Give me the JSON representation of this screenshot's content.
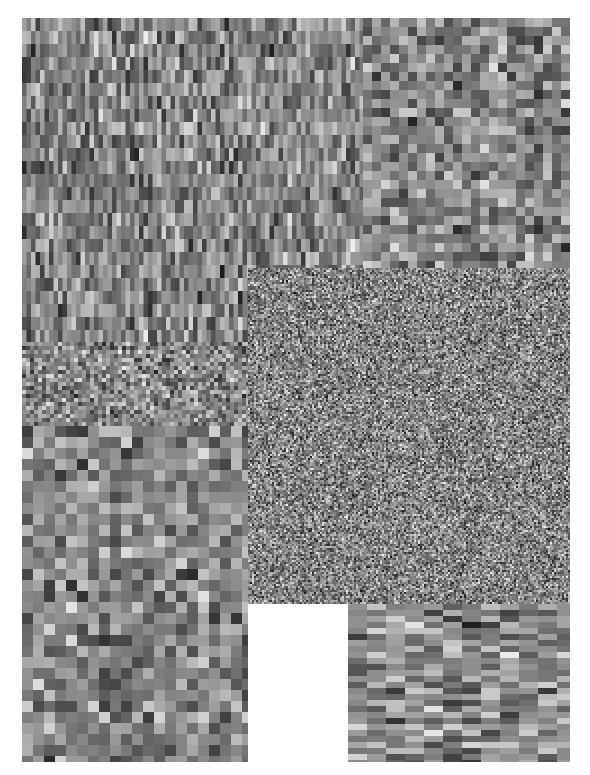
{
  "image": {
    "title": "grayscale-block-noise-composite",
    "width": 590,
    "height": 775,
    "background_color": "#ffffff",
    "colorspace": "grayscale",
    "margin": {
      "left": 22,
      "top": 18,
      "right": 20,
      "bottom": 13
    },
    "content_box": {
      "x": 22,
      "y": 18,
      "width": 548,
      "height": 744
    },
    "description": "Six rectangular regions of pseudo-random grayscale blocks, each region using a different block granularity and aspect ratio.",
    "regions": [
      {
        "name": "top-left-vertical-stripes",
        "label": "Tall narrow vertical blocks",
        "x": 22,
        "y": 18,
        "width": 341,
        "height": 324,
        "cell_width": 4.5,
        "cell_height": 13,
        "gray_min": 18,
        "gray_max": 248,
        "seed": 1301
      },
      {
        "name": "top-right-squares",
        "label": "Medium square blocks",
        "x": 363,
        "y": 18,
        "width": 207,
        "height": 250,
        "cell_width": 9,
        "cell_height": 9,
        "gray_min": 26,
        "gray_max": 242,
        "seed": 2207
      },
      {
        "name": "left-mid-fine-band",
        "label": "Fine mixed band",
        "x": 22,
        "y": 342,
        "width": 226,
        "height": 84,
        "cell_width": 4,
        "cell_height": 4,
        "gray_min": 24,
        "gray_max": 250,
        "seed": 3109
      },
      {
        "name": "bottom-left-large-squares",
        "label": "Large square blocks",
        "x": 22,
        "y": 426,
        "width": 226,
        "height": 336,
        "cell_width": 11,
        "cell_height": 11,
        "gray_min": 22,
        "gray_max": 246,
        "seed": 4421
      },
      {
        "name": "center-fine-noise",
        "label": "Dense fine-grain noise",
        "x": 248,
        "y": 268,
        "width": 322,
        "height": 336,
        "cell_width": 2,
        "cell_height": 2,
        "gray_min": 10,
        "gray_max": 252,
        "seed": 5507
      },
      {
        "name": "bottom-right-horizontal-stripes",
        "label": "Wide short horizontal blocks",
        "x": 348,
        "y": 604,
        "width": 222,
        "height": 158,
        "cell_width": 19,
        "cell_height": 6,
        "gray_min": 28,
        "gray_max": 250,
        "seed": 6619
      }
    ]
  },
  "chart_data": {
    "type": "heatmap",
    "xlabel": "",
    "ylabel": "",
    "colorscale": "grayscale",
    "value_range": [
      0,
      255
    ],
    "grid": false,
    "legend": "none",
    "panel_count": 6,
    "panels": [
      {
        "name": "top-left-vertical-stripes",
        "cols": 76,
        "rows": 25,
        "cell_aspect": "tall-narrow",
        "mean_gray": 128
      },
      {
        "name": "top-right-squares",
        "cols": 23,
        "rows": 28,
        "cell_aspect": "square",
        "mean_gray": 130
      },
      {
        "name": "left-mid-fine-band",
        "cols": 57,
        "rows": 21,
        "cell_aspect": "square",
        "mean_gray": 132
      },
      {
        "name": "bottom-left-large-squares",
        "cols": 21,
        "rows": 31,
        "cell_aspect": "square",
        "mean_gray": 127
      },
      {
        "name": "center-fine-noise",
        "cols": 161,
        "rows": 168,
        "cell_aspect": "square",
        "mean_gray": 129
      },
      {
        "name": "bottom-right-horizontal-stripes",
        "cols": 12,
        "rows": 27,
        "cell_aspect": "wide-short",
        "mean_gray": 131
      }
    ]
  }
}
